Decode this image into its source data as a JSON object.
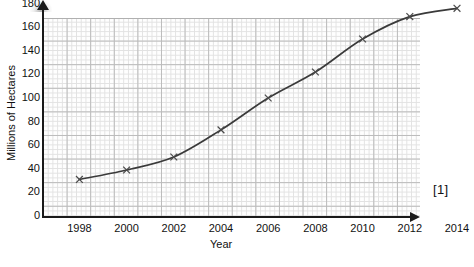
{
  "chart_data": {
    "type": "line",
    "title": "",
    "xlabel": "Year",
    "ylabel": "Millions of Hectares",
    "x": [
      1998,
      2000,
      2002,
      2004,
      2006,
      2008,
      2010,
      2012,
      2014
    ],
    "values": [
      31,
      39,
      50,
      73,
      100,
      122,
      150,
      169,
      176
    ],
    "series": [
      {
        "name": "Millions of Hectares",
        "values": [
          31,
          39,
          50,
          73,
          100,
          122,
          150,
          169,
          176
        ]
      }
    ],
    "xlim": [
      1997,
      2015
    ],
    "ylim": [
      0,
      190
    ],
    "xticks": [
      "1998",
      "2000",
      "2002",
      "2004",
      "2006",
      "2008",
      "2010",
      "2012",
      "2014"
    ],
    "yticks": [
      "0",
      "20",
      "40",
      "60",
      "80",
      "100",
      "120",
      "140",
      "160",
      "180"
    ],
    "ytick_values": [
      0,
      20,
      40,
      60,
      80,
      100,
      120,
      140,
      160,
      180
    ],
    "grid": true,
    "grid_style": "graph-paper",
    "legend": "none",
    "marker": "x",
    "line_color": "#3a3a3a",
    "grid_major_color": "#b9b9b9",
    "grid_minor_color": "#e2e2e2",
    "axis_color": "#1a1a1a"
  },
  "annotations": {
    "marks": "[1]"
  }
}
